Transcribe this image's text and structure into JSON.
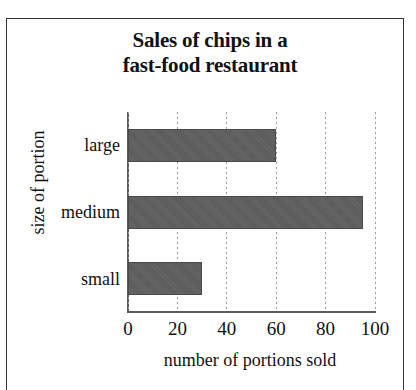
{
  "chart_data": {
    "type": "bar",
    "orientation": "horizontal",
    "title": "Sales of chips in a fast-food restaurant",
    "title_lines": [
      "Sales of chips in a",
      "fast-food restaurant"
    ],
    "categories": [
      "small",
      "medium",
      "large"
    ],
    "values": [
      30,
      95,
      60
    ],
    "xlabel": "number of portions sold",
    "ylabel": "size of portion",
    "xlim": [
      0,
      100
    ],
    "xticks": [
      0,
      20,
      40,
      60,
      80,
      100
    ],
    "xtick_labels": [
      "0",
      "20",
      "40",
      "60",
      "80",
      "100"
    ],
    "grid": "vertical-dotted",
    "legend": null,
    "bar_color": "#5f5f5f",
    "axis_color": "#5a5a5a",
    "grid_color": "#9a9a9a",
    "background": "#ffffff"
  }
}
